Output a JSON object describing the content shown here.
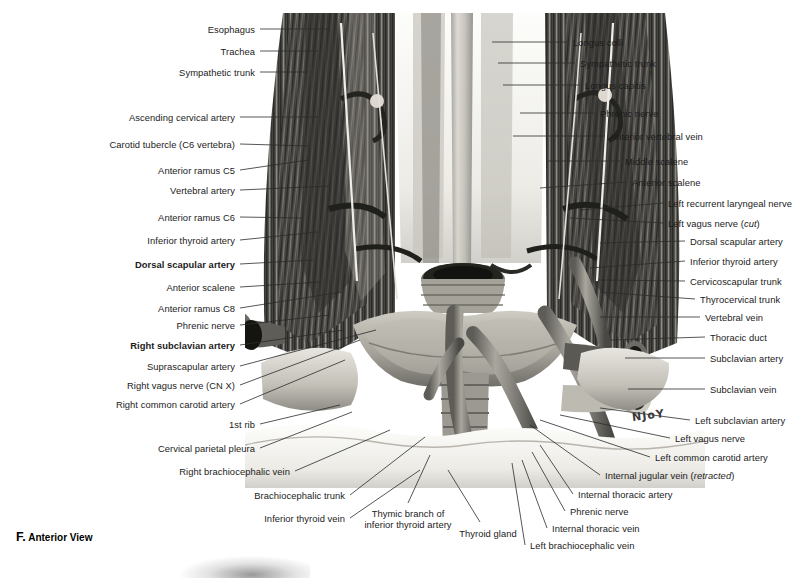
{
  "figure": {
    "caption_letter": "F.",
    "caption_text": "Anterior View",
    "artist_signature": "NJoY"
  },
  "labels_left": [
    {
      "text": "Esophagus",
      "x": 255,
      "y": 29,
      "bold": false,
      "lx1": 260,
      "ly1": 29,
      "lx2": 330,
      "ly2": 29
    },
    {
      "text": "Trachea",
      "x": 255,
      "y": 51,
      "bold": false,
      "lx1": 260,
      "ly1": 51,
      "lx2": 318,
      "ly2": 51
    },
    {
      "text": "Sympathetic trunk",
      "x": 255,
      "y": 72,
      "bold": false,
      "lx1": 260,
      "ly1": 72,
      "lx2": 308,
      "ly2": 72
    },
    {
      "text": "Ascending cervical artery",
      "x": 235,
      "y": 117,
      "bold": false,
      "lx1": 240,
      "ly1": 117,
      "lx2": 318,
      "ly2": 117
    },
    {
      "text": "Carotid tubercle (C6 vertebra)",
      "x": 235,
      "y": 144,
      "bold": false,
      "lx1": 240,
      "ly1": 144,
      "lx2": 308,
      "ly2": 146
    },
    {
      "text": "Anterior ramus C5",
      "x": 235,
      "y": 170,
      "bold": false,
      "lx1": 240,
      "ly1": 170,
      "lx2": 308,
      "ly2": 160
    },
    {
      "text": "Vertebral artery",
      "x": 235,
      "y": 190,
      "bold": false,
      "lx1": 240,
      "ly1": 190,
      "lx2": 330,
      "ly2": 186
    },
    {
      "text": "Anterior ramus C6",
      "x": 235,
      "y": 217,
      "bold": false,
      "lx1": 240,
      "ly1": 217,
      "lx2": 302,
      "ly2": 218
    },
    {
      "text": "Inferior thyroid artery",
      "x": 235,
      "y": 240,
      "bold": false,
      "lx1": 240,
      "ly1": 240,
      "lx2": 318,
      "ly2": 232
    },
    {
      "text": "Dorsal scapular artery",
      "x": 235,
      "y": 264,
      "bold": true,
      "lx1": 240,
      "ly1": 264,
      "lx2": 313,
      "ly2": 260
    },
    {
      "text": "Anterior scalene",
      "x": 235,
      "y": 287,
      "bold": false,
      "lx1": 240,
      "ly1": 287,
      "lx2": 320,
      "ly2": 282
    },
    {
      "text": "Anterior ramus C8",
      "x": 235,
      "y": 308,
      "bold": false,
      "lx1": 240,
      "ly1": 308,
      "lx2": 342,
      "ly2": 292
    },
    {
      "text": "Phrenic nerve",
      "x": 235,
      "y": 325,
      "bold": false,
      "lx1": 240,
      "ly1": 325,
      "lx2": 330,
      "ly2": 315
    },
    {
      "text": "Right subclavian artery",
      "x": 235,
      "y": 345,
      "bold": true,
      "lx1": 240,
      "ly1": 345,
      "lx2": 344,
      "ly2": 330
    },
    {
      "text": "Suprascapular artery",
      "x": 235,
      "y": 366,
      "bold": false,
      "lx1": 240,
      "ly1": 366,
      "lx2": 376,
      "ly2": 330
    },
    {
      "text": "Right vagus nerve (CN X)",
      "x": 235,
      "y": 385,
      "bold": false,
      "lx1": 240,
      "ly1": 385,
      "lx2": 360,
      "ly2": 340
    },
    {
      "text": "Right common carotid artery",
      "x": 235,
      "y": 404,
      "bold": false,
      "lx1": 240,
      "ly1": 404,
      "lx2": 345,
      "ly2": 360
    },
    {
      "text": "1st rib",
      "x": 255,
      "y": 424,
      "bold": false,
      "lx1": 260,
      "ly1": 424,
      "lx2": 340,
      "ly2": 405
    },
    {
      "text": "Cervical parietal pleura",
      "x": 255,
      "y": 448,
      "bold": false,
      "lx1": 260,
      "ly1": 448,
      "lx2": 352,
      "ly2": 412
    },
    {
      "text": "Right brachiocephalic vein",
      "x": 290,
      "y": 471,
      "bold": false,
      "lx1": 295,
      "ly1": 471,
      "lx2": 390,
      "ly2": 430
    },
    {
      "text": "Brachiocephalic trunk",
      "x": 345,
      "y": 495,
      "bold": false,
      "lx1": 350,
      "ly1": 495,
      "lx2": 425,
      "ly2": 437
    },
    {
      "text": "Inferior thyroid vein",
      "x": 345,
      "y": 518,
      "bold": false,
      "lx1": 350,
      "ly1": 518,
      "lx2": 420,
      "ly2": 470
    }
  ],
  "labels_right": [
    {
      "text": "Longus colli",
      "x": 573,
      "y": 42,
      "lx1": 568,
      "ly1": 42,
      "lx2": 492,
      "ly2": 42
    },
    {
      "text": "Sympathetic trunk",
      "x": 580,
      "y": 63,
      "lx1": 575,
      "ly1": 63,
      "lx2": 498,
      "ly2": 63
    },
    {
      "text": "Longus capitis",
      "x": 585,
      "y": 85,
      "lx1": 580,
      "ly1": 85,
      "lx2": 503,
      "ly2": 85
    },
    {
      "text": "Phrenic nerve",
      "x": 600,
      "y": 113,
      "lx1": 595,
      "ly1": 113,
      "lx2": 520,
      "ly2": 113
    },
    {
      "text": "Anterior vertebral vein",
      "x": 610,
      "y": 136,
      "lx1": 605,
      "ly1": 136,
      "lx2": 513,
      "ly2": 136
    },
    {
      "text": "Middle scalene",
      "x": 625,
      "y": 161,
      "lx1": 620,
      "ly1": 161,
      "lx2": 548,
      "ly2": 161
    },
    {
      "text": "Anterior scalene",
      "x": 632,
      "y": 182,
      "lx1": 627,
      "ly1": 182,
      "lx2": 540,
      "ly2": 188
    },
    {
      "text": "Left recurrent laryngeal nerve",
      "x": 668,
      "y": 203,
      "lx1": 663,
      "ly1": 203,
      "lx2": 580,
      "ly2": 210
    },
    {
      "text": "Left vagus nerve ",
      "italic": "cut",
      "suffix": ")",
      "prefix_paren": "(",
      "x": 668,
      "y": 223,
      "lx1": 663,
      "ly1": 223,
      "lx2": 570,
      "ly2": 218
    },
    {
      "text": "Dorsal scapular artery",
      "x": 690,
      "y": 241,
      "lx1": 685,
      "ly1": 241,
      "lx2": 600,
      "ly2": 243
    },
    {
      "text": "Inferior thyroid artery",
      "x": 690,
      "y": 261,
      "lx1": 685,
      "ly1": 261,
      "lx2": 590,
      "ly2": 268
    },
    {
      "text": "Cervicoscapular trunk",
      "x": 690,
      "y": 281,
      "lx1": 685,
      "ly1": 281,
      "lx2": 598,
      "ly2": 280
    },
    {
      "text": "Thyrocervical trunk",
      "x": 700,
      "y": 299,
      "lx1": 695,
      "ly1": 299,
      "lx2": 600,
      "ly2": 292
    },
    {
      "text": "Vertebral vein",
      "x": 705,
      "y": 317,
      "lx1": 700,
      "ly1": 317,
      "lx2": 600,
      "ly2": 317
    },
    {
      "text": "Thoracic duct",
      "x": 710,
      "y": 337,
      "lx1": 705,
      "ly1": 337,
      "lx2": 610,
      "ly2": 340
    },
    {
      "text": "Subclavian artery",
      "x": 710,
      "y": 358,
      "lx1": 705,
      "ly1": 358,
      "lx2": 625,
      "ly2": 358
    },
    {
      "text": "Subclavian vein",
      "x": 710,
      "y": 389,
      "lx1": 705,
      "ly1": 389,
      "lx2": 628,
      "ly2": 389
    },
    {
      "text": "Left subclavian artery",
      "x": 695,
      "y": 420,
      "lx1": 690,
      "ly1": 420,
      "lx2": 600,
      "ly2": 408
    },
    {
      "text": "Left vagus nerve",
      "x": 675,
      "y": 438,
      "lx1": 670,
      "ly1": 438,
      "lx2": 560,
      "ly2": 415
    },
    {
      "text": "Left common carotid artery",
      "x": 655,
      "y": 457,
      "lx1": 650,
      "ly1": 457,
      "lx2": 540,
      "ly2": 420
    },
    {
      "text": "Internal jugular vein ",
      "italic": "retracted",
      "prefix_paren": "(",
      "suffix": ")",
      "x": 605,
      "y": 475,
      "lx1": 600,
      "ly1": 475,
      "lx2": 530,
      "ly2": 425
    },
    {
      "text": "Internal thoracic artery",
      "x": 578,
      "y": 494,
      "lx1": 573,
      "ly1": 494,
      "lx2": 540,
      "ly2": 445
    },
    {
      "text": "Phrenic nerve",
      "x": 570,
      "y": 511,
      "lx1": 565,
      "ly1": 511,
      "lx2": 532,
      "ly2": 452
    },
    {
      "text": "Internal thoracic vein",
      "x": 552,
      "y": 528,
      "lx1": 547,
      "ly1": 528,
      "lx2": 522,
      "ly2": 460
    },
    {
      "text": "Left brachiocephalic vein",
      "x": 530,
      "y": 545,
      "lx1": 525,
      "ly1": 545,
      "lx2": 512,
      "ly2": 463
    }
  ],
  "labels_bottom": [
    {
      "text_line1": "Thymic branch of",
      "text_line2": "inferior thyroid artery",
      "x": 408,
      "y": 508,
      "lx1": 408,
      "ly1": 503,
      "lx2": 430,
      "ly2": 455
    },
    {
      "text_line1": "Thyroid gland",
      "text_line2": "",
      "x": 488,
      "y": 528,
      "lx1": 480,
      "ly1": 522,
      "lx2": 448,
      "ly2": 470
    }
  ]
}
